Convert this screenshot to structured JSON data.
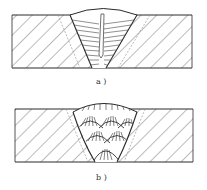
{
  "figure": {
    "panels": [
      {
        "id": "a",
        "label": "a )",
        "description": "Weld cross-section with columnar grains growing toward weld centerline"
      },
      {
        "id": "b",
        "label": "b )",
        "description": "Multi-pass weld cross-section with layered fan-shaped bead grains"
      }
    ],
    "colors": {
      "line": "#2a2a2a",
      "hatch": "#555555",
      "background": "#ffffff"
    }
  }
}
